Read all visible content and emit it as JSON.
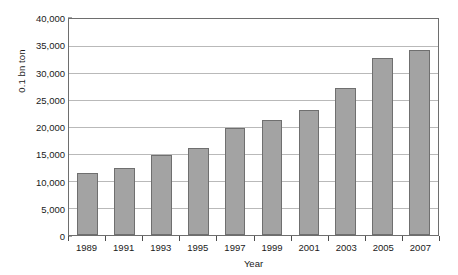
{
  "chart_data": {
    "type": "bar",
    "title": "",
    "subtitle": "",
    "xlabel": "Year",
    "ylabel": "0.1 bn ton",
    "categories": [
      "1989",
      "1991",
      "1993",
      "1995",
      "1997",
      "1999",
      "2001",
      "2003",
      "2005",
      "2007"
    ],
    "values": [
      11400,
      12400,
      14900,
      16200,
      19900,
      21300,
      23100,
      27200,
      32800,
      34300
    ],
    "series": [
      {
        "name": "Production",
        "values": [
          11400,
          12400,
          14900,
          16200,
          19900,
          21300,
          23100,
          27200,
          32800,
          34300
        ]
      }
    ],
    "ylim": [
      0,
      40000
    ],
    "xlim": null,
    "ytick_values": [
      0,
      5000,
      10000,
      15000,
      20000,
      25000,
      30000,
      35000,
      40000
    ],
    "ytick_labels": [
      "0",
      "5,000",
      "10,000",
      "15,000",
      "20,000",
      "25,000",
      "30,000",
      "35,000",
      "40,000"
    ],
    "xtick_labels": [
      "1989",
      "1991",
      "1993",
      "1995",
      "1997",
      "1999",
      "2001",
      "2003",
      "2005",
      "2007"
    ],
    "grid": "horizontal",
    "legend": "none",
    "annotations": [],
    "bar_color": "#a3a3a3",
    "bar_border_color": "#6f6f6f",
    "gridline_color": "#b9b9b9",
    "frame_color": "#6e6e6e",
    "background_color": "#ffffff",
    "text_color": "#1a1a1a"
  }
}
